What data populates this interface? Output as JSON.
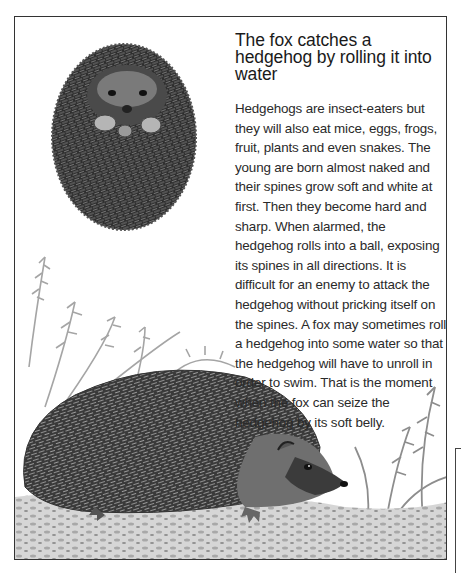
{
  "article": {
    "heading": "The fox catches a hedgehog by rolling it into water",
    "body": "Hedgehogs are insect-eaters but they will also eat mice, eggs, frogs, fruit, plants and even snakes. The young are born almost naked and their spines grow soft and white at first. Then they become hard and sharp. When alarmed, the hedgehog rolls into a ball, exposing its spines in all directions. It is difficult for an enemy to attack the hedgehog without pricking itself on the spines. A fox may sometimes roll a hedgehog into some water so that the hedgehog will have to unroll in order to swim. That is the moment when the fox can seize the hedgehog by its soft belly."
  },
  "illustrations": [
    {
      "name": "rolled-hedgehog",
      "description": "Hedgehog curled into a ball"
    },
    {
      "name": "walking-hedgehog",
      "description": "Hedgehog walking among ferns and leaves"
    }
  ],
  "colors": {
    "ink": "#222222",
    "spine_dark": "#2b2b2b",
    "spine_mid": "#6a6a6a",
    "foliage": "#9a9a9a",
    "ground": "#b8b8b8",
    "paper": "#ffffff"
  }
}
